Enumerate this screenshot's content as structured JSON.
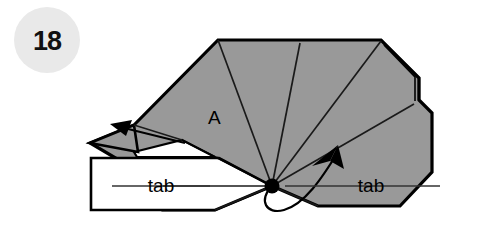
{
  "figure": {
    "step_badge": {
      "number": "18",
      "circle_color": "#e9e9e9"
    },
    "colors": {
      "paper_gray": "#999999",
      "paper_white": "#ffffff",
      "ink": "#000000",
      "crease": "#1a1a1a",
      "background": "#ffffff"
    },
    "labels": {
      "panel_a": "A",
      "tab_left": "tab",
      "tab_right": "tab"
    },
    "annotations": {
      "vertex_dot": "center-vertex",
      "arrow_left": "fold-arrow-left",
      "arrow_right": "curved-fold-arrow-right",
      "leader_line_left": "tab-leader-line-left",
      "leader_line_right": "tab-leader-line-right"
    }
  }
}
